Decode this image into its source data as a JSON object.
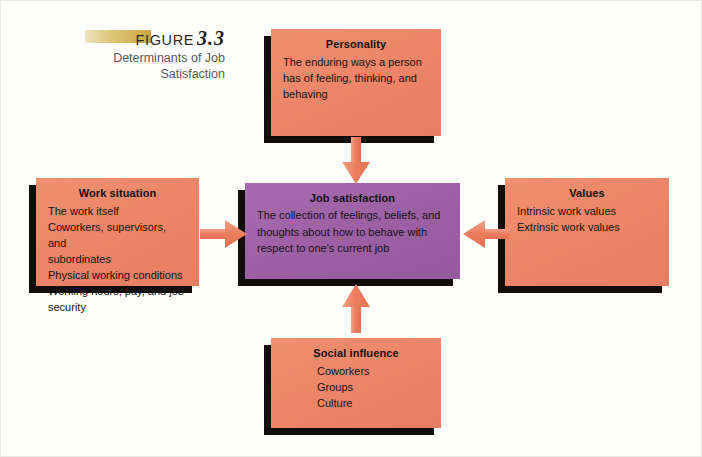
{
  "figure": {
    "label": "FIGURE",
    "number": "3.3",
    "caption_line1": "Determinants of Job",
    "caption_line2": "Satisfaction"
  },
  "colors": {
    "box_salmon": "#ec8366",
    "box_purple": "#9c5fa4",
    "shadow": "#100d0c",
    "arrow": "#ea7a5e",
    "gold_bar": "#c9a63f",
    "caption_gray": "#58585a",
    "page_background": "#fefefd"
  },
  "boxes": {
    "personality": {
      "title": "Personality",
      "lines": [
        "The enduring ways a person",
        "has of feeling, thinking, and",
        "behaving"
      ]
    },
    "work_situation": {
      "title": "Work situation",
      "lines": [
        "The work itself",
        "Coworkers, supervisors, and",
        "subordinates",
        "Physical working conditions",
        "Working hours, pay, and job security"
      ]
    },
    "job_satisfaction": {
      "title": "Job satisfaction",
      "lines": [
        "The collection of feelings, beliefs, and",
        "thoughts about how to behave with",
        "respect to one's current job"
      ]
    },
    "values": {
      "title": "Values",
      "lines": [
        "Intrinsic work values",
        "Extrinsic work values"
      ]
    },
    "social_influence": {
      "title": "Social influence",
      "lines": [
        "Coworkers",
        "Groups",
        "Culture"
      ]
    }
  },
  "arrows": [
    {
      "name": "personality-to-job-satisfaction",
      "direction": "down"
    },
    {
      "name": "social-influence-to-job-satisfaction",
      "direction": "up"
    },
    {
      "name": "work-situation-to-job-satisfaction",
      "direction": "right"
    },
    {
      "name": "values-to-job-satisfaction",
      "direction": "left"
    }
  ]
}
